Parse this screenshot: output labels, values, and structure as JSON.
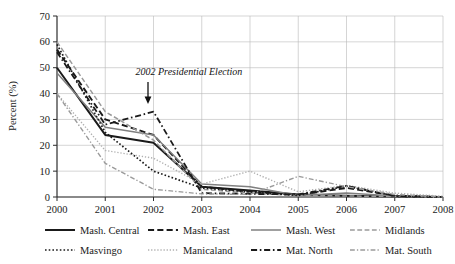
{
  "chart_data": {
    "type": "line",
    "title": "",
    "xlabel": "",
    "ylabel": "Percent (%)",
    "x": [
      2000,
      2001,
      2002,
      2003,
      2004,
      2005,
      2006,
      2007,
      2008
    ],
    "xtick_labels": [
      "2000",
      "2001",
      "2002",
      "2003",
      "2004",
      "2005",
      "2006",
      "2007",
      "2008"
    ],
    "ytick_labels": [
      "0",
      "10",
      "20",
      "30",
      "40",
      "50",
      "60",
      "70"
    ],
    "xlim": [
      2000,
      2008
    ],
    "ylim": [
      0,
      70
    ],
    "grid": true,
    "legend_position": "bottom",
    "annotations": [
      {
        "text": "2002 Presidential Election",
        "x": 2002,
        "y": 39,
        "marker": "down-arrow"
      }
    ],
    "series": [
      {
        "name": "Mash. Central",
        "style": "solid",
        "color": "#1a1a1a",
        "width": 2.0,
        "values": [
          50,
          24,
          21,
          4,
          2.5,
          1,
          0.5,
          0.2,
          0
        ]
      },
      {
        "name": "Mash. East",
        "style": "dashed",
        "color": "#1a1a1a",
        "width": 1.9,
        "values": [
          57,
          30,
          24,
          4,
          2,
          0.8,
          3.5,
          0.5,
          0
        ]
      },
      {
        "name": "Mash. West",
        "style": "solid",
        "color": "#808080",
        "width": 1.5,
        "values": [
          48,
          27,
          24,
          5,
          4,
          0.6,
          1.5,
          0.4,
          0
        ]
      },
      {
        "name": "Midlands",
        "style": "dashed",
        "color": "#9a9a9a",
        "width": 1.5,
        "values": [
          60,
          33,
          22,
          3,
          1.5,
          0.6,
          0.4,
          0.2,
          0
        ]
      },
      {
        "name": "Masvingo",
        "style": "dotted",
        "color": "#1a1a1a",
        "width": 1.7,
        "values": [
          59,
          25,
          10,
          3.5,
          2,
          0.6,
          4.2,
          0.4,
          0
        ]
      },
      {
        "name": "Manicaland",
        "style": "dotted",
        "color": "#b0b0b0",
        "width": 1.4,
        "values": [
          40,
          18,
          15,
          5,
          10,
          2,
          4.5,
          1.5,
          0.3
        ]
      },
      {
        "name": "Mat. North",
        "style": "dashdot",
        "color": "#1a1a1a",
        "width": 1.8,
        "values": [
          56,
          28,
          33,
          1.5,
          1.2,
          1,
          4.3,
          0.4,
          0
        ]
      },
      {
        "name": "Mat. South",
        "style": "dashdot",
        "color": "#9a9a9a",
        "width": 1.4,
        "values": [
          40,
          13,
          3,
          1.2,
          1,
          8,
          4.0,
          1,
          0
        ]
      }
    ]
  },
  "legend": {
    "entries": [
      {
        "label": "Mash. Central"
      },
      {
        "label": "Mash. East"
      },
      {
        "label": "Mash. West"
      },
      {
        "label": "Midlands"
      },
      {
        "label": "Masvingo"
      },
      {
        "label": "Manicaland"
      },
      {
        "label": "Mat. North"
      },
      {
        "label": "Mat. South"
      }
    ]
  }
}
